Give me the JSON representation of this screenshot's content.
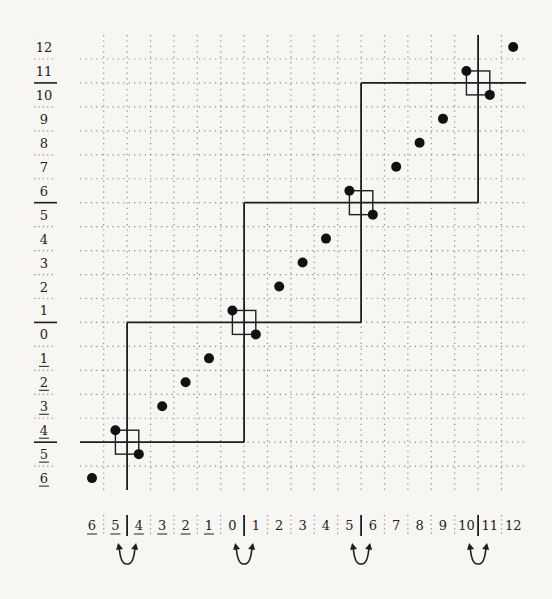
{
  "figure": {
    "title": "",
    "row_labels": [
      {
        "text": "12",
        "underlined": false
      },
      {
        "text": "11",
        "underlined": false
      },
      {
        "text": "10",
        "underlined": false
      },
      {
        "text": "9",
        "underlined": false
      },
      {
        "text": "8",
        "underlined": false
      },
      {
        "text": "7",
        "underlined": false
      },
      {
        "text": "6",
        "underlined": false
      },
      {
        "text": "5",
        "underlined": false
      },
      {
        "text": "4",
        "underlined": false
      },
      {
        "text": "3",
        "underlined": false
      },
      {
        "text": "2",
        "underlined": false
      },
      {
        "text": "1",
        "underlined": false
      },
      {
        "text": "0",
        "underlined": false
      },
      {
        "text": "1",
        "underlined": true
      },
      {
        "text": "2",
        "underlined": true
      },
      {
        "text": "3",
        "underlined": true
      },
      {
        "text": "4",
        "underlined": true
      },
      {
        "text": "5",
        "underlined": true
      },
      {
        "text": "6",
        "underlined": true
      }
    ],
    "row_solid_separators_after": [
      "11",
      "6",
      "1",
      "4̲"
    ],
    "column_labels": [
      {
        "text": "6",
        "underlined": true
      },
      {
        "text": "5",
        "underlined": true
      },
      {
        "text": "4",
        "underlined": true
      },
      {
        "text": "3",
        "underlined": true
      },
      {
        "text": "2",
        "underlined": true
      },
      {
        "text": "1",
        "underlined": true
      },
      {
        "text": "0",
        "underlined": false
      },
      {
        "text": "1",
        "underlined": false
      },
      {
        "text": "2",
        "underlined": false
      },
      {
        "text": "3",
        "underlined": false
      },
      {
        "text": "4",
        "underlined": false
      },
      {
        "text": "5",
        "underlined": false
      },
      {
        "text": "6",
        "underlined": false
      },
      {
        "text": "7",
        "underlined": false
      },
      {
        "text": "8",
        "underlined": false
      },
      {
        "text": "9",
        "underlined": false
      },
      {
        "text": "10",
        "underlined": false
      },
      {
        "text": "11",
        "underlined": false
      },
      {
        "text": "12",
        "underlined": false
      }
    ],
    "column_solid_separators_between": [
      [
        "5̲",
        "4̲"
      ],
      [
        "0",
        "1"
      ],
      [
        "5",
        "6"
      ],
      [
        "10",
        "11"
      ]
    ],
    "swap_arrows_between": [
      [
        "5̲",
        "4̲"
      ],
      [
        "0",
        "1"
      ],
      [
        "5",
        "6"
      ],
      [
        "10",
        "11"
      ]
    ],
    "points": [
      {
        "col": "6̲",
        "row": "6̲"
      },
      {
        "col": "5̲",
        "row": "4̲"
      },
      {
        "col": "4̲",
        "row": "5̲"
      },
      {
        "col": "3̲",
        "row": "3̲"
      },
      {
        "col": "2̲",
        "row": "2̲"
      },
      {
        "col": "1̲",
        "row": "1̲"
      },
      {
        "col": "0",
        "row": "1"
      },
      {
        "col": "1",
        "row": "0"
      },
      {
        "col": "2",
        "row": "2"
      },
      {
        "col": "3",
        "row": "3"
      },
      {
        "col": "4",
        "row": "4"
      },
      {
        "col": "5",
        "row": "6"
      },
      {
        "col": "6",
        "row": "5"
      },
      {
        "col": "7",
        "row": "7"
      },
      {
        "col": "8",
        "row": "8"
      },
      {
        "col": "9",
        "row": "9"
      },
      {
        "col": "10",
        "row": "11"
      },
      {
        "col": "11",
        "row": "10"
      },
      {
        "col": "12",
        "row": "12"
      }
    ],
    "staircase_boxes": 4,
    "colors": {
      "ink": "#1e1e1e",
      "grid_dots": "#8a8a8a",
      "paper": "#f7f6f3"
    }
  }
}
